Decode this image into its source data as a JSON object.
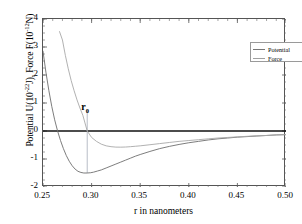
{
  "chart_data": {
    "type": "line",
    "title": "",
    "xlabel": "r in nanometers",
    "ylabel": "Potential U(10⁻²²J),  Force F(10⁻¹²N)",
    "ylabel_parts": {
      "seg1": "Potential U(10",
      "exp1": "-22",
      "seg2": "J),  Force F(10",
      "exp2": "-12",
      "seg3": "N)"
    },
    "xlim": [
      0.25,
      0.5
    ],
    "ylim": [
      -2,
      4
    ],
    "xticks": [
      "0.25",
      "0.30",
      "0.35",
      "0.40",
      "0.45",
      "0.50"
    ],
    "xtick_values": [
      0.25,
      0.3,
      0.35,
      0.4,
      0.45,
      0.5
    ],
    "yticks": [
      "4",
      "3",
      "2",
      "1",
      "0",
      "-1",
      "-2"
    ],
    "ytick_values": [
      4,
      3,
      2,
      1,
      0,
      -1,
      -2
    ],
    "grid": false,
    "legend_position": "top-right",
    "zero_line": 0,
    "annotations": [
      {
        "text": "r",
        "sub": "0",
        "x": 0.2955,
        "y": 0.85,
        "dropline_from": 0.75,
        "dropline_to": -1.5
      }
    ],
    "series": [
      {
        "name": "Potential",
        "color": "#6e6e6e",
        "x": [
          0.25,
          0.253,
          0.256,
          0.259,
          0.262,
          0.265,
          0.268,
          0.271,
          0.274,
          0.277,
          0.28,
          0.283,
          0.286,
          0.289,
          0.292,
          0.2955,
          0.299,
          0.302,
          0.306,
          0.31,
          0.315,
          0.32,
          0.325,
          0.33,
          0.335,
          0.34,
          0.345,
          0.35,
          0.36,
          0.37,
          0.38,
          0.39,
          0.4,
          0.41,
          0.42,
          0.43,
          0.44,
          0.45,
          0.46,
          0.47,
          0.48,
          0.49,
          0.5
        ],
        "y": [
          2.85,
          2.1,
          1.45,
          0.88,
          0.4,
          0.0,
          -0.34,
          -0.63,
          -0.88,
          -1.08,
          -1.24,
          -1.36,
          -1.44,
          -1.48,
          -1.5,
          -1.5,
          -1.49,
          -1.47,
          -1.43,
          -1.39,
          -1.32,
          -1.25,
          -1.18,
          -1.11,
          -1.04,
          -0.97,
          -0.9,
          -0.84,
          -0.73,
          -0.63,
          -0.55,
          -0.48,
          -0.42,
          -0.37,
          -0.32,
          -0.28,
          -0.25,
          -0.22,
          -0.2,
          -0.18,
          -0.16,
          -0.14,
          -0.13
        ]
      },
      {
        "name": "Force",
        "color": "#a8a8a8",
        "x": [
          0.267,
          0.27,
          0.273,
          0.276,
          0.279,
          0.282,
          0.285,
          0.288,
          0.291,
          0.2955,
          0.3,
          0.305,
          0.31,
          0.315,
          0.32,
          0.325,
          0.33,
          0.335,
          0.34,
          0.345,
          0.35,
          0.36,
          0.37,
          0.38,
          0.39,
          0.4,
          0.41,
          0.42,
          0.43,
          0.44,
          0.45,
          0.46,
          0.47,
          0.48,
          0.49,
          0.5
        ],
        "y": [
          3.55,
          3.25,
          2.7,
          2.22,
          1.8,
          1.44,
          1.11,
          0.82,
          0.56,
          0.0,
          -0.23,
          -0.37,
          -0.47,
          -0.53,
          -0.56,
          -0.575,
          -0.577,
          -0.572,
          -0.56,
          -0.545,
          -0.53,
          -0.49,
          -0.45,
          -0.41,
          -0.37,
          -0.34,
          -0.31,
          -0.28,
          -0.25,
          -0.23,
          -0.21,
          -0.19,
          -0.17,
          -0.16,
          -0.14,
          -0.13
        ]
      }
    ]
  },
  "legend": {
    "items": [
      {
        "label": "Potential"
      },
      {
        "label": "Force"
      }
    ]
  }
}
